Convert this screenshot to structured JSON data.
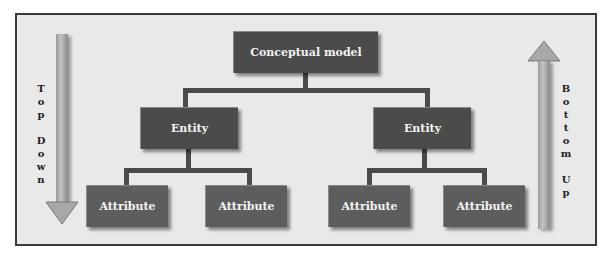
{
  "diagram": {
    "root": {
      "label": "Conceptual model"
    },
    "entities": [
      {
        "label": "Entity",
        "attributes": [
          {
            "label": "Attribute"
          },
          {
            "label": "Attribute"
          }
        ]
      },
      {
        "label": "Entity",
        "attributes": [
          {
            "label": "Attribute"
          },
          {
            "label": "Attribute"
          }
        ]
      }
    ],
    "left_arrow": {
      "direction": "down",
      "words": [
        "Top",
        "Down"
      ],
      "letters": [
        "T",
        "o",
        "p",
        "",
        "D",
        "o",
        "w",
        "n"
      ]
    },
    "right_arrow": {
      "direction": "up",
      "words": [
        "Bottom",
        "Up"
      ],
      "letters": [
        "B",
        "o",
        "t",
        "t",
        "o",
        "m",
        "",
        "U",
        "p"
      ]
    },
    "colors": {
      "box_dark": "#4b4b4b",
      "box_mid": "#5d5d5d",
      "connector": "#4a4a4a",
      "background": "#e9e9e9",
      "arrow": "#aaaaaa"
    }
  }
}
